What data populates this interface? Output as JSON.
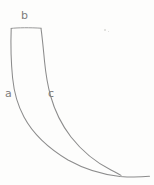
{
  "figure": {
    "kind": "hand-drawn-line-diagram",
    "canvas": {
      "width": 154,
      "height": 185
    },
    "background_color": "#fdfdfc",
    "ink_color": "#8c8c8c",
    "label_color": "#7d7d7d"
  },
  "labels": {
    "a": "a",
    "b": "b",
    "c": "c"
  },
  "label_roles": {
    "a": "left outer curve",
    "b": "top horizontal edge",
    "c": "right inner curve"
  },
  "strokes": {
    "top_edge": {
      "name": "b",
      "type": "line",
      "from": [
        11,
        28
      ],
      "to": [
        41,
        28
      ]
    },
    "left_curve": {
      "name": "a",
      "type": "curve",
      "from": [
        11,
        28
      ],
      "to": [
        148,
        176
      ]
    },
    "right_curve": {
      "name": "c",
      "type": "curve",
      "from": [
        41,
        28
      ],
      "to": [
        148,
        176
      ]
    }
  }
}
